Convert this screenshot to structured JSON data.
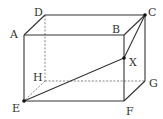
{
  "figure": {
    "type": "rectangular-prism",
    "vertices": {
      "A": {
        "label": "A",
        "x": 24,
        "y": 35
      },
      "B": {
        "label": "B",
        "x": 124,
        "y": 35
      },
      "C": {
        "label": "C",
        "x": 145,
        "y": 15
      },
      "D": {
        "label": "D",
        "x": 45,
        "y": 15
      },
      "E": {
        "label": "E",
        "x": 24,
        "y": 101
      },
      "F": {
        "label": "F",
        "x": 124,
        "y": 101
      },
      "G": {
        "label": "G",
        "x": 145,
        "y": 81
      },
      "H": {
        "label": "H",
        "x": 45,
        "y": 81
      }
    },
    "special_points": {
      "X": {
        "label": "X",
        "x": 124,
        "y": 58,
        "on_edge": "BF"
      }
    },
    "visible_edges": [
      "AB",
      "AD",
      "DC",
      "BC",
      "AE",
      "BF",
      "CG",
      "EF",
      "FG"
    ],
    "hidden_edges": [
      "DH",
      "HE",
      "HG"
    ],
    "segments": [
      "EX",
      "XC",
      "BX",
      "EH-diag"
    ],
    "marked_points": [
      "C",
      "X",
      "E"
    ],
    "colors": {
      "line": "#333333",
      "hidden_line": "#777777",
      "point": "#111111",
      "background": "#ffffff"
    }
  },
  "labels": {
    "A": "A",
    "B": "B",
    "C": "C",
    "D": "D",
    "E": "E",
    "F": "F",
    "G": "G",
    "H": "H",
    "X": "X"
  }
}
